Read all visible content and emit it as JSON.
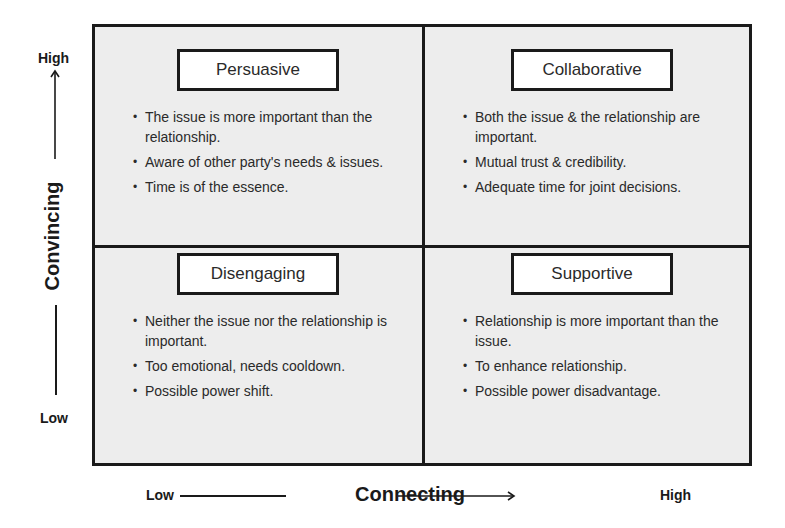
{
  "matrix": {
    "quadrants": [
      {
        "label": "Persuasive",
        "bullets": [
          "The issue is more important than the relationship.",
          "Aware of other party's needs & issues.",
          "Time is of the essence."
        ]
      },
      {
        "label": "Collaborative",
        "bullets": [
          "Both the issue & the relationship are important.",
          "Mutual trust & credibility.",
          "Adequate time for joint decisions."
        ]
      },
      {
        "label": "Disengaging",
        "bullets": [
          "Neither the issue nor the relationship is important.",
          "Too emotional, needs cooldown.",
          "Possible power shift."
        ]
      },
      {
        "label": "Supportive",
        "bullets": [
          "Relationship is more important than the issue.",
          "To enhance relationship.",
          "Possible power disadvantage."
        ]
      }
    ]
  },
  "y_axis": {
    "title": "Convincing",
    "high": "High",
    "low": "Low"
  },
  "x_axis": {
    "title": "Connecting",
    "high": "High",
    "low": "Low"
  }
}
